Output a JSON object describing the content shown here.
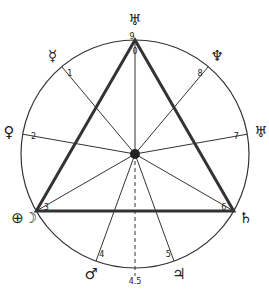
{
  "diagram": {
    "center": [
      135,
      154
    ],
    "radius": 114,
    "colors": {
      "line": "#333333",
      "bg": "#ffffff"
    },
    "points": [
      {
        "id": "9",
        "angle": 0,
        "label": "9",
        "symbol": "♅",
        "symbol_name": "uranus-symbol"
      },
      {
        "id": "1",
        "angle": 320,
        "label": "1",
        "symbol": "☿",
        "symbol_name": "mercury-symbol"
      },
      {
        "id": "2",
        "angle": 280,
        "label": "2",
        "symbol": "♀",
        "symbol_name": "venus-symbol"
      },
      {
        "id": "3",
        "angle": 240,
        "label": "3",
        "symbol": "⊕☽",
        "symbol_name": "earth-moon-symbol"
      },
      {
        "id": "4",
        "angle": 200,
        "label": "4",
        "symbol": "♂",
        "symbol_name": "mars-symbol"
      },
      {
        "id": "5",
        "angle": 160,
        "label": "5",
        "symbol": "♃",
        "symbol_name": "jupiter-symbol"
      },
      {
        "id": "6",
        "angle": 120,
        "label": "6",
        "symbol": "♄",
        "symbol_name": "saturn-symbol"
      },
      {
        "id": "7",
        "angle": 80,
        "label": "7",
        "symbol": "♅",
        "symbol_name": "uranus-alt-symbol"
      },
      {
        "id": "8",
        "angle": 40,
        "label": "8",
        "symbol": "♆",
        "symbol_name": "neptune-symbol"
      }
    ],
    "inner_label": "0",
    "bottom_label": "4.5",
    "triangle": [
      "9",
      "3",
      "6"
    ]
  }
}
